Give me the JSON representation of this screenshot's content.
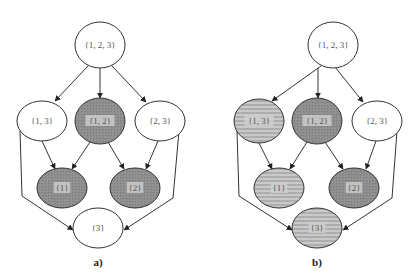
{
  "figure": {
    "panels": [
      {
        "id": "a",
        "label": "a)",
        "label_pos": [
          98,
          266
        ],
        "nodes": [
          {
            "id": "123",
            "label": "{1, 2, 3}",
            "cx": 100,
            "cy": 45,
            "rx": 25,
            "ry": 23,
            "fill": "white"
          },
          {
            "id": "13",
            "label": "{1, 3}",
            "cx": 42,
            "cy": 121,
            "rx": 25,
            "ry": 20,
            "fill": "white"
          },
          {
            "id": "12",
            "label": "{1, 2}",
            "cx": 100,
            "cy": 121,
            "rx": 25,
            "ry": 23,
            "fill": "dark"
          },
          {
            "id": "23",
            "label": "{2, 3}",
            "cx": 160,
            "cy": 121,
            "rx": 25,
            "ry": 20,
            "fill": "white"
          },
          {
            "id": "1",
            "label": "{1}",
            "cx": 62,
            "cy": 188,
            "rx": 25,
            "ry": 20,
            "fill": "dark"
          },
          {
            "id": "2",
            "label": "{2}",
            "cx": 135,
            "cy": 188,
            "rx": 25,
            "ry": 20,
            "fill": "dark"
          },
          {
            "id": "3",
            "label": "{3}",
            "cx": 98,
            "cy": 228,
            "rx": 25,
            "ry": 20,
            "fill": "white"
          }
        ]
      },
      {
        "id": "b",
        "label": "b)",
        "label_pos": [
          317,
          266
        ],
        "nodes": [
          {
            "id": "123",
            "label": "{1, 2, 3}",
            "cx": 333,
            "cy": 45,
            "rx": 25,
            "ry": 23,
            "fill": "white"
          },
          {
            "id": "13",
            "label": "{1, 3}",
            "cx": 259,
            "cy": 121,
            "rx": 25,
            "ry": 22,
            "fill": "striped"
          },
          {
            "id": "12",
            "label": "{1, 2}",
            "cx": 317,
            "cy": 121,
            "rx": 25,
            "ry": 23,
            "fill": "dark"
          },
          {
            "id": "23",
            "label": "{2, 3}",
            "cx": 377,
            "cy": 121,
            "rx": 25,
            "ry": 20,
            "fill": "white"
          },
          {
            "id": "1",
            "label": "{1}",
            "cx": 279,
            "cy": 188,
            "rx": 25,
            "ry": 20,
            "fill": "striped"
          },
          {
            "id": "2",
            "label": "{2}",
            "cx": 354,
            "cy": 188,
            "rx": 25,
            "ry": 20,
            "fill": "dark"
          },
          {
            "id": "3",
            "label": "{3}",
            "cx": 317,
            "cy": 228,
            "rx": 25,
            "ry": 20,
            "fill": "striped"
          }
        ]
      }
    ],
    "colors": {
      "stroke": "#333333",
      "white_fill": "#ffffff",
      "dark_fill": "#8c8c8c",
      "striped_light": "#c8c8c8",
      "striped_dark": "#a8a8a8",
      "label_box": "#d0d0d0"
    }
  }
}
